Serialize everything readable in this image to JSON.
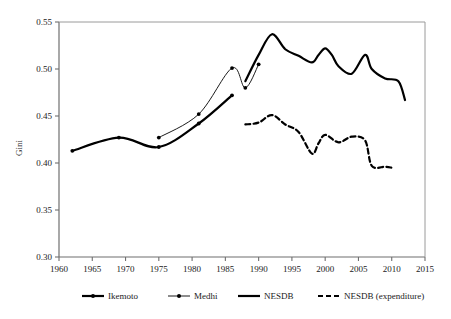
{
  "chart_data": {
    "type": "line",
    "title": "",
    "xlabel": "",
    "ylabel": "Gini",
    "xlim": [
      1960,
      2015
    ],
    "ylim": [
      0.3,
      0.55
    ],
    "grid": false,
    "legend_position": "bottom",
    "xticks": [
      1960,
      1965,
      1970,
      1975,
      1980,
      1985,
      1990,
      1995,
      2000,
      2005,
      2010,
      2015
    ],
    "xtick_labels": [
      "1960",
      "1965",
      "1970",
      "1975",
      "1980",
      "1985",
      "1990",
      "1995",
      "2000",
      "2005",
      "2010",
      "2015"
    ],
    "yticks": [
      0.3,
      0.35,
      0.4,
      0.45,
      0.5,
      0.55
    ],
    "ytick_labels": [
      "0.30",
      "0.35",
      "0.40",
      "0.45",
      "0.50",
      "0.55"
    ],
    "series": [
      {
        "name": "Ikemoto",
        "style": "thick-solid-markers",
        "markers": true,
        "color": "#000000",
        "width": 2.2,
        "x": [
          1962,
          1969,
          1975,
          1981,
          1986
        ],
        "y": [
          0.413,
          0.427,
          0.417,
          0.442,
          0.472
        ]
      },
      {
        "name": "Medhi",
        "style": "thin-solid-markers",
        "markers": true,
        "color": "#000000",
        "width": 0.9,
        "x": [
          1975,
          1981,
          1986,
          1988,
          1990
        ],
        "y": [
          0.427,
          0.452,
          0.501,
          0.48,
          0.505
        ]
      },
      {
        "name": "NESDB",
        "style": "thick-solid",
        "markers": false,
        "color": "#000000",
        "width": 2.2,
        "x": [
          1988,
          1990,
          1992,
          1994,
          1996,
          1998,
          1999,
          2000,
          2001,
          2002,
          2004,
          2006,
          2007,
          2009,
          2011,
          2012
        ],
        "y": [
          0.487,
          0.515,
          0.537,
          0.521,
          0.514,
          0.507,
          0.515,
          0.522,
          0.515,
          0.503,
          0.495,
          0.515,
          0.5,
          0.49,
          0.487,
          0.467
        ]
      },
      {
        "name": "NESDB (expenditure)",
        "style": "thick-dashed",
        "markers": false,
        "color": "#000000",
        "width": 2.2,
        "x": [
          1988,
          1990,
          1992,
          1994,
          1996,
          1998,
          1999,
          2000,
          2002,
          2004,
          2006,
          2007,
          2009,
          2010
        ],
        "y": [
          0.441,
          0.443,
          0.451,
          0.441,
          0.433,
          0.41,
          0.421,
          0.43,
          0.422,
          0.428,
          0.424,
          0.397,
          0.396,
          0.395
        ]
      }
    ]
  },
  "legend": {
    "items": [
      {
        "label": "Ikemoto",
        "style": "thick-solid-markers"
      },
      {
        "label": "Medhi",
        "style": "thin-solid-markers"
      },
      {
        "label": "NESDB",
        "style": "thick-solid"
      },
      {
        "label": "NESDB (expenditure)",
        "style": "thick-dashed"
      }
    ]
  }
}
